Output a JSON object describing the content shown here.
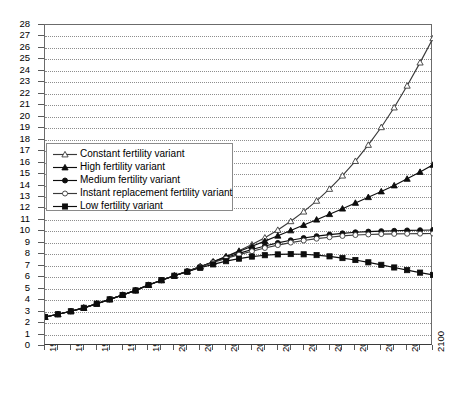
{
  "chart_data": {
    "type": "line",
    "title": "",
    "subtitle": "",
    "xlabel": "",
    "ylabel": "",
    "xlim": [
      1950,
      2100
    ],
    "ylim": [
      0,
      28
    ],
    "grid": true,
    "legend_position": "inside-upper-left",
    "y_ticks": [
      0,
      1,
      2,
      3,
      4,
      5,
      6,
      7,
      8,
      9,
      10,
      11,
      12,
      13,
      14,
      15,
      16,
      17,
      18,
      19,
      20,
      21,
      22,
      23,
      24,
      25,
      26,
      27,
      28
    ],
    "x_ticks": [
      1950,
      1960,
      1970,
      1980,
      1990,
      2000,
      2010,
      2020,
      2030,
      2040,
      2050,
      2060,
      2070,
      2080,
      2090,
      2100
    ],
    "x_minor_step": 5,
    "x": [
      1950,
      1955,
      1960,
      1965,
      1970,
      1975,
      1980,
      1985,
      1990,
      1995,
      2000,
      2005,
      2010,
      2015,
      2020,
      2025,
      2030,
      2035,
      2040,
      2045,
      2050,
      2055,
      2060,
      2065,
      2070,
      2075,
      2080,
      2085,
      2090,
      2095,
      2100
    ],
    "series": [
      {
        "name": "Constant fertility variant",
        "marker": "open-triangle",
        "color": "#3a3a3a",
        "values": [
          2.53,
          2.77,
          3.03,
          3.33,
          3.69,
          4.07,
          4.45,
          4.85,
          5.32,
          5.74,
          6.13,
          6.51,
          6.92,
          7.35,
          7.8,
          8.3,
          8.85,
          9.45,
          10.12,
          10.88,
          11.72,
          12.66,
          13.7,
          14.86,
          16.13,
          17.54,
          19.08,
          20.8,
          22.7,
          24.72,
          26.84
        ]
      },
      {
        "name": "High fertility variant",
        "marker": "filled-triangle",
        "color": "#0d0d0d",
        "values": [
          2.53,
          2.77,
          3.03,
          3.33,
          3.69,
          4.07,
          4.45,
          4.85,
          5.32,
          5.74,
          6.13,
          6.51,
          6.92,
          7.35,
          7.8,
          8.25,
          8.7,
          9.15,
          9.62,
          10.08,
          10.55,
          11.02,
          11.5,
          11.98,
          12.48,
          12.98,
          13.48,
          14.0,
          14.58,
          15.18,
          15.8
        ]
      },
      {
        "name": "Medium fertility variant",
        "marker": "filled-circle",
        "color": "#0d0d0d",
        "values": [
          2.53,
          2.77,
          3.03,
          3.33,
          3.69,
          4.07,
          4.45,
          4.85,
          5.32,
          5.74,
          6.13,
          6.51,
          6.92,
          7.32,
          7.72,
          8.08,
          8.42,
          8.72,
          8.99,
          9.22,
          9.42,
          9.58,
          9.72,
          9.83,
          9.92,
          9.98,
          10.02,
          10.05,
          10.08,
          10.1,
          10.12
        ]
      },
      {
        "name": "Instant replacement fertility variant",
        "marker": "open-circle",
        "color": "#3a3a3a",
        "values": [
          2.53,
          2.77,
          3.03,
          3.33,
          3.69,
          4.07,
          4.45,
          4.85,
          5.32,
          5.74,
          6.13,
          6.51,
          6.9,
          7.28,
          7.64,
          7.97,
          8.27,
          8.55,
          8.8,
          9.02,
          9.2,
          9.36,
          9.49,
          9.6,
          9.68,
          9.73,
          9.76,
          9.78,
          9.79,
          9.8,
          9.81
        ]
      },
      {
        "name": "Low fertility variant",
        "marker": "filled-square",
        "color": "#0d0d0d",
        "values": [
          2.53,
          2.77,
          3.03,
          3.33,
          3.69,
          4.07,
          4.45,
          4.85,
          5.32,
          5.74,
          6.13,
          6.48,
          6.82,
          7.12,
          7.4,
          7.62,
          7.8,
          7.92,
          7.99,
          8.02,
          8.0,
          7.93,
          7.82,
          7.67,
          7.5,
          7.3,
          7.08,
          6.85,
          6.62,
          6.4,
          6.2
        ]
      }
    ]
  }
}
